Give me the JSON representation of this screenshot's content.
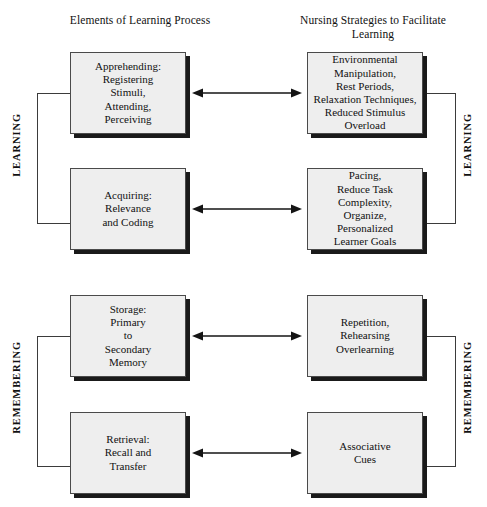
{
  "diagram": {
    "headers": {
      "left": "Elements of\nLearning Process",
      "right": "Nursing Strategies to\nFacilitate Learning"
    },
    "side_labels": {
      "learning_left": "LEARNING",
      "learning_right": "LEARNING",
      "remembering_left": "REMEMBERING",
      "remembering_right": "REMEMBERING"
    },
    "rows": [
      {
        "left": "Apprehending:\nRegistering\nStimuli,\nAttending,\nPerceiving",
        "right": "Environmental\nManipulation,\nRest Periods,\nRelaxation Techniques,\nReduced Stimulus\nOverload",
        "connector": "double-arrow"
      },
      {
        "left": "Acquiring:\nRelevance\nand Coding",
        "right": "Pacing,\nReduce Task\nComplexity,\nOrganize,\nPersonalized\nLearner Goals",
        "connector": "double-arrow"
      },
      {
        "left": "Storage:\nPrimary\nto\nSecondary\nMemory",
        "right": "Repetition,\nRehearsing\nOverlearning",
        "connector": "double-arrow"
      },
      {
        "left": "Retrieval:\nRecall and\nTransfer",
        "right": "Associative\nCues",
        "connector": "double-arrow"
      }
    ],
    "colors": {
      "box_fill": "#eeeeee",
      "box_border": "#4a4a4a",
      "box_shadow": "#1a1a1a",
      "line": "#3b3b3b",
      "text": "#111111",
      "background": "#ffffff"
    }
  }
}
